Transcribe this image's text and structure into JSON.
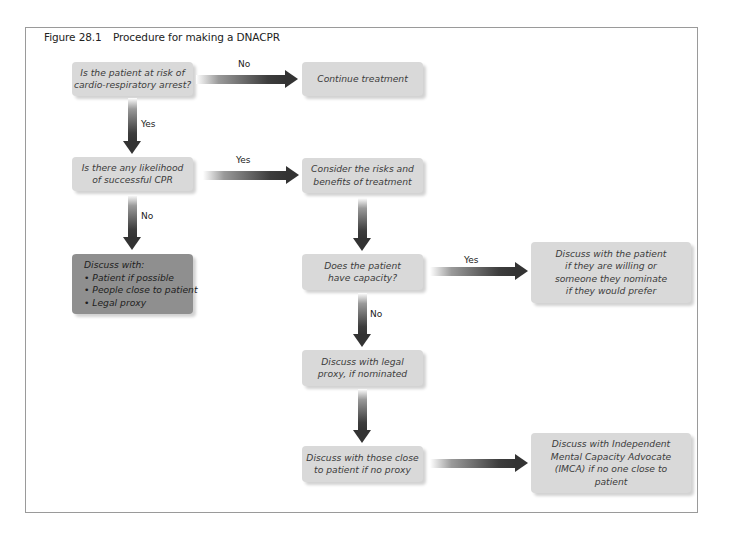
{
  "figure": {
    "number": "Figure 28.1",
    "title": "Procedure for making a DNACPR"
  },
  "nodes": {
    "risk_question": {
      "lines": [
        "Is the patient at risk of",
        "cardio-respiratory arrest?"
      ]
    },
    "continue_treatment": {
      "lines": [
        "Continue treatment"
      ]
    },
    "cpr_likelihood": {
      "lines": [
        "Is there any likelihood",
        "of successful CPR"
      ]
    },
    "consider_risks": {
      "lines": [
        "Consider the risks and",
        "benefits of treatment"
      ]
    },
    "discuss_with": {
      "heading": "Discuss with:",
      "items": [
        "Patient if possible",
        "People close to patient",
        "Legal proxy"
      ]
    },
    "capacity_question": {
      "lines": [
        "Does the patient",
        "have capacity?"
      ]
    },
    "discuss_patient": {
      "lines": [
        "Discuss with the patient",
        "if they are willing or",
        "someone they nominate",
        "if they would prefer"
      ]
    },
    "legal_proxy": {
      "lines": [
        "Discuss with legal",
        "proxy, if nominated"
      ]
    },
    "close_to_patient": {
      "lines": [
        "Discuss with those close",
        "to patient if no proxy"
      ]
    },
    "imca": {
      "lines": [
        "Discuss with Independent",
        "Mental Capacity Advocate",
        "(IMCA) if no one close to",
        "patient"
      ]
    }
  },
  "edges": {
    "risk_no": "No",
    "risk_yes": "Yes",
    "cpr_yes": "Yes",
    "cpr_no": "No",
    "capacity_yes": "Yes",
    "capacity_no": "No"
  },
  "colors": {
    "box_fill": "#d9d9d9",
    "dark_box_fill": "#8f8f8f",
    "arrow": "#333333",
    "frame_border": "#9a9a9a"
  }
}
